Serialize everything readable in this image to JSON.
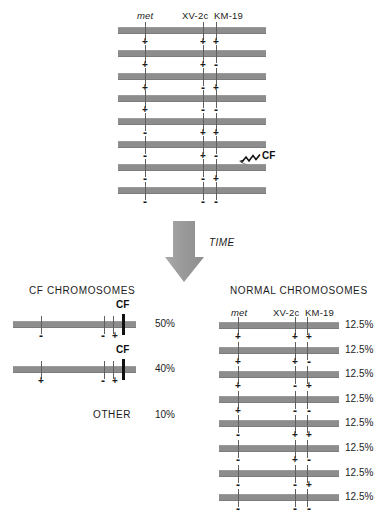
{
  "figure": {
    "title_hidden": "",
    "band_color": "#8d8d8d",
    "cf_marker_color": "#111111",
    "text_color": "#1c1c1c"
  },
  "top_panel": {
    "locus_labels": [
      {
        "text": "met",
        "style": "italic"
      },
      {
        "text": "XV-2c",
        "style": "normal"
      },
      {
        "text": "KM-19",
        "style": "normal"
      }
    ],
    "haplotypes": [
      {
        "met": "+",
        "xv2c": "+",
        "km19": "+"
      },
      {
        "met": "+",
        "xv2c": "+",
        "km19": "-"
      },
      {
        "met": "+",
        "xv2c": "-",
        "km19": "+"
      },
      {
        "met": "+",
        "xv2c": "-",
        "km19": "-"
      },
      {
        "met": "-",
        "xv2c": "+",
        "km19": "+"
      },
      {
        "met": "-",
        "xv2c": "+",
        "km19": "-"
      },
      {
        "met": "-",
        "xv2c": "-",
        "km19": "+"
      },
      {
        "met": "-",
        "xv2c": "-",
        "km19": "-"
      }
    ],
    "cf_pointer_label": "CF",
    "cf_pointer_target_row": 6
  },
  "time_arrow": {
    "label": "TIME"
  },
  "cf_panel": {
    "heading": "CF  CHROMOSOMES",
    "cf_tag": "CF",
    "rows": [
      {
        "met": "-",
        "xv2c": "-",
        "km19": "+",
        "cf": true,
        "percent": "50%"
      },
      {
        "met": "+",
        "xv2c": "-",
        "km19": "+",
        "cf": true,
        "percent": "40%"
      }
    ],
    "other_label": "OTHER",
    "other_percent": "10%"
  },
  "normal_panel": {
    "heading": "NORMAL CHROMOSOMES",
    "locus_labels": [
      {
        "text": "met",
        "style": "italic"
      },
      {
        "text": "XV-2c",
        "style": "normal"
      },
      {
        "text": "KM-19",
        "style": "normal"
      }
    ],
    "rows": [
      {
        "met": "+",
        "xv2c": "+",
        "km19": "+",
        "percent": "12.5%"
      },
      {
        "met": "+",
        "xv2c": "+",
        "km19": "-",
        "percent": "12.5%"
      },
      {
        "met": "+",
        "xv2c": "-",
        "km19": "+",
        "percent": "12.5%"
      },
      {
        "met": "+",
        "xv2c": "-",
        "km19": "-",
        "percent": "12.5%"
      },
      {
        "met": "-",
        "xv2c": "+",
        "km19": "+",
        "percent": "12.5%"
      },
      {
        "met": "-",
        "xv2c": "+",
        "km19": "-",
        "percent": "12.5%"
      },
      {
        "met": "-",
        "xv2c": "-",
        "km19": "+",
        "percent": "12.5%"
      },
      {
        "met": "-",
        "xv2c": "-",
        "km19": "-",
        "percent": "12.5%"
      }
    ]
  }
}
